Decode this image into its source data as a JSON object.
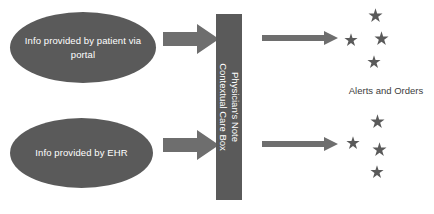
{
  "diagram": {
    "colors": {
      "node_fill": "#5a5a5a",
      "arrow_fill": "#6e6e6e",
      "star_fill": "#5a5a5a",
      "node_text": "#ffffff",
      "label_text": "#3d3d3d",
      "background": "#ffffff"
    },
    "inputs": [
      {
        "id": "patient-portal",
        "label": "Info provided by patient via portal",
        "icon": "ellipse-node"
      },
      {
        "id": "ehr",
        "label": "Info provided by EHR",
        "icon": "ellipse-node"
      }
    ],
    "process": {
      "id": "contextual-care-box",
      "line1": "Physician's Note",
      "line2": "Contextual Care Box",
      "orientation": "vertical-rotated-90"
    },
    "connectors": {
      "input_arrow_icon": "block-arrow-right-icon",
      "output_arrow_icon": "line-arrow-right-icon",
      "input_arrow_count": 2,
      "output_arrow_count": 2
    },
    "outputs": {
      "label": "Alerts and Orders",
      "star_icon": "star-icon",
      "clusters": [
        {
          "id": "alerts-top",
          "stars": [
            {
              "x": 28,
              "y": 0,
              "size": 15
            },
            {
              "x": 4,
              "y": 25,
              "size": 14
            },
            {
              "x": 34,
              "y": 23,
              "size": 15
            },
            {
              "x": 27,
              "y": 47,
              "size": 14
            }
          ]
        },
        {
          "id": "orders-bottom",
          "stars": [
            {
              "x": 30,
              "y": 0,
              "size": 15
            },
            {
              "x": 6,
              "y": 22,
              "size": 14
            },
            {
              "x": 32,
              "y": 28,
              "size": 15
            },
            {
              "x": 30,
              "y": 51,
              "size": 14
            }
          ]
        }
      ]
    }
  }
}
